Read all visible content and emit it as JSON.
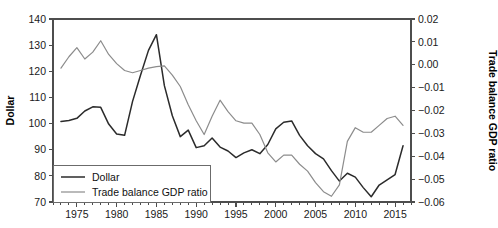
{
  "chart_data": {
    "type": "line",
    "title": "",
    "xlabel": "",
    "ylabel": "Dollar",
    "y2label": "Trade balance GDP ratio",
    "grid": false,
    "legend_position": "bottom-left",
    "xlim": [
      1972,
      2017
    ],
    "ylim": [
      70,
      140
    ],
    "y2lim": [
      -0.06,
      0.02
    ],
    "xticks": [
      1975,
      1980,
      1985,
      1990,
      1995,
      2000,
      2005,
      2010,
      2015
    ],
    "xticklabels": [
      "1975",
      "1980",
      "1985",
      "1990",
      "1995",
      "2000",
      "2005",
      "2010",
      "2015"
    ],
    "xtick_minor_step": 1,
    "yticks": [
      70,
      80,
      90,
      100,
      110,
      120,
      130,
      140
    ],
    "yticklabels": [
      "70",
      "80",
      "90",
      "100",
      "110",
      "120",
      "130",
      "140"
    ],
    "y2ticks": [
      -0.06,
      -0.05,
      -0.04,
      -0.03,
      -0.02,
      -0.01,
      0.0,
      0.01,
      0.02
    ],
    "y2ticklabels": [
      "−0.06",
      "−0.05",
      "−0.04",
      "−0.03",
      "−0.02",
      "−0.01",
      "0.00",
      "0.01",
      "0.02"
    ],
    "series": [
      {
        "name": "Dollar",
        "axis": "left",
        "color": "#2b2b2b",
        "width": 1.5,
        "x": [
          1973,
          1974,
          1975,
          1976,
          1977,
          1978,
          1979,
          1980,
          1981,
          1982,
          1983,
          1984,
          1985,
          1986,
          1987,
          1988,
          1989,
          1990,
          1991,
          1992,
          1993,
          1994,
          1995,
          1996,
          1997,
          1998,
          1999,
          2000,
          2001,
          2002,
          2003,
          2004,
          2005,
          2006,
          2007,
          2008,
          2009,
          2010,
          2011,
          2012,
          2013,
          2014,
          2015,
          2016
        ],
        "y": [
          100.8,
          101.2,
          102.0,
          104.8,
          106.4,
          106.2,
          99.8,
          96.0,
          95.5,
          108.5,
          118.5,
          128.0,
          134.0,
          114.5,
          103.0,
          95.0,
          97.5,
          90.8,
          91.5,
          94.5,
          91.0,
          89.5,
          87.0,
          88.8,
          90.0,
          88.5,
          92.0,
          98.0,
          100.5,
          101.0,
          95.5,
          91.5,
          88.5,
          86.5,
          82.0,
          78.0,
          81.0,
          79.5,
          75.5,
          72.0,
          76.5,
          78.5,
          80.5,
          91.5
        ]
      },
      {
        "name": "Trade balance GDP ratio",
        "axis": "right",
        "color": "#8c8c8c",
        "width": 1.2,
        "x": [
          1973,
          1974,
          1975,
          1976,
          1977,
          1978,
          1979,
          1980,
          1981,
          1982,
          1983,
          1984,
          1985,
          1986,
          1987,
          1988,
          1989,
          1990,
          1991,
          1992,
          1993,
          1994,
          1995,
          1996,
          1997,
          1998,
          1999,
          2000,
          2001,
          2002,
          2003,
          2004,
          2005,
          2006,
          2007,
          2008,
          2009,
          2010,
          2011,
          2012,
          2013,
          2014,
          2015,
          2016
        ],
        "y": [
          -0.0015,
          0.0035,
          0.0075,
          0.0025,
          0.0055,
          0.0105,
          0.0045,
          0.0005,
          -0.0025,
          -0.0035,
          -0.0025,
          -0.0015,
          -0.0008,
          -0.0005,
          -0.0045,
          -0.0095,
          -0.0175,
          -0.0245,
          -0.0305,
          -0.0225,
          -0.0155,
          -0.0205,
          -0.0245,
          -0.0255,
          -0.0255,
          -0.0305,
          -0.0385,
          -0.0425,
          -0.0395,
          -0.0395,
          -0.0435,
          -0.0465,
          -0.0515,
          -0.0555,
          -0.0575,
          -0.0525,
          -0.0335,
          -0.0275,
          -0.0295,
          -0.0295,
          -0.0265,
          -0.0235,
          -0.0225,
          -0.0265
        ]
      }
    ],
    "legend": [
      {
        "label": "Dollar",
        "color": "#2b2b2b",
        "width": 1.5
      },
      {
        "label": "Trade balance GDP ratio",
        "color": "#8c8c8c",
        "width": 1.2
      }
    ]
  },
  "layout": {
    "plot_left": 53,
    "plot_right": 411,
    "plot_top": 19,
    "plot_bottom": 202,
    "legend_x": 53,
    "legend_y": 165,
    "legend_w": 157,
    "legend_h": 37
  }
}
